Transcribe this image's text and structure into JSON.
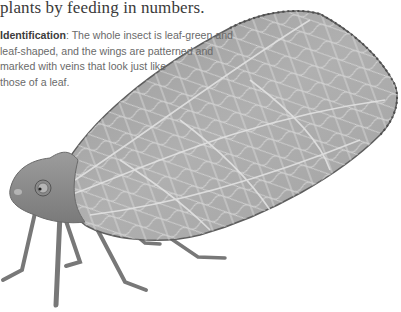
{
  "document": {
    "lead_text": "plants by feeding in numbers.",
    "identification": {
      "label": "Identification",
      "separator": ":",
      "lines": [
        " The whole insect is leaf-green and",
        "leaf-shaped, and the wings are patterned and",
        "marked with veins that look just like",
        "those of a leaf."
      ]
    },
    "illustration": {
      "subject": "leaf-like insect (side view)",
      "style": "grayscale painted illustration",
      "colors": {
        "wing_fill": "#a9a9a9",
        "wing_vein": "#d9d9d9",
        "wing_edge": "#5a5a5a",
        "body_fill": "#8c8c8c",
        "leg": "#7a7a7a"
      }
    }
  }
}
